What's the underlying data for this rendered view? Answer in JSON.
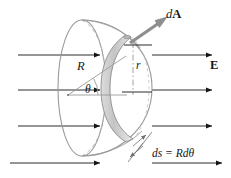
{
  "figure": {
    "background_color": "#ffffff",
    "stroke_color": "#151515",
    "surface_stroke_color": "#8c8c8c",
    "ring_fill_color": "#c9c9c9",
    "ring_fill_light": "#e3e3e3",
    "arrow_fill_color": "#8f8f8f",
    "width": 231,
    "height": 178
  },
  "labels": {
    "area_vector": "dA",
    "area_vector_prefix": "d",
    "area_vector_symbol": "A",
    "field": "E",
    "radius": "R",
    "angle": "θ",
    "ring_radius": "r",
    "arc_length": "ds = Rdθ",
    "arc_length_lhs": "ds",
    "arc_length_equals": "=",
    "arc_length_rhs": "Rdθ"
  },
  "field_lines": {
    "count": 4,
    "direction": "left-to-right",
    "y_positions": [
      55,
      90,
      126,
      163
    ],
    "label": "E"
  },
  "geometry": {
    "dome_center": {
      "x": 68,
      "y": 95
    },
    "dome_rim_ellipse": {
      "cx": 82,
      "cy": 88,
      "rx": 24,
      "ry": 68
    },
    "dome_edge_ellipse": {
      "cx": 110,
      "cy": 88,
      "rx": 42,
      "ry": 68
    },
    "ring_band": {
      "cx": 118,
      "cy": 88,
      "rx": 17,
      "ry": 55
    },
    "radius_line": {
      "from": {
        "x": 68,
        "y": 95
      },
      "to": {
        "x": 124,
        "y": 57
      }
    },
    "horizontal_axis": {
      "from": {
        "x": 68,
        "y": 95
      },
      "to": {
        "x": 125,
        "y": 95
      }
    },
    "area_vector_arrow": {
      "from": {
        "x": 130,
        "y": 42
      },
      "to": {
        "x": 166,
        "y": 18
      }
    },
    "ring_radius_line": {
      "from": {
        "x": 133,
        "y": 44
      },
      "to": {
        "x": 133,
        "y": 95
      }
    }
  }
}
